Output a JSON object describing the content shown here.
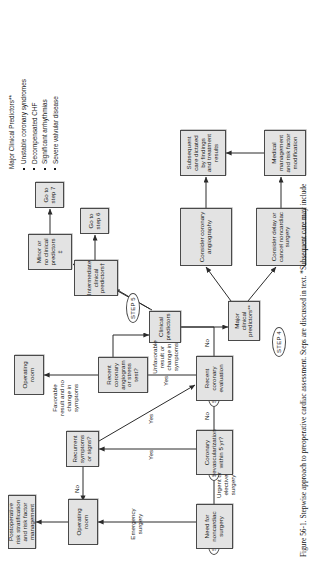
{
  "figure": {
    "number": "Figure 56-1.",
    "caption": "Stepwise approach to preoperative cardiac assessment. Steps are discussed in text. *Subsequent care may include"
  },
  "steps": [
    {
      "id": "step1",
      "label": "STEP 1"
    },
    {
      "id": "step2",
      "label": "STEP 2"
    },
    {
      "id": "step3",
      "label": "STEP 3"
    },
    {
      "id": "step4",
      "label": "STEP 4"
    },
    {
      "id": "step5",
      "label": "STEP 5"
    }
  ],
  "nodes": {
    "need_surgery": "Need for noncardiac surgery",
    "coronary_revasc": "Coronary revascularization within 5 yr?",
    "recent_coronary_eval": "Recent coronary evaluation",
    "operating_room_1": "Operating room",
    "postop_risk": "Postoperative risk stratification and risk factor management",
    "recurrent_symptoms": "Recurrent symptoms or signs?",
    "recent_angiogram": "Recent coronary angiogram or stress test?",
    "operating_room_2": "Operating room",
    "clinical_predictors": "Clinical predictors",
    "major_predictors": "Major clinical predictors**",
    "intermediate_predictors": "Intermediate clinical predictors†",
    "minor_predictors": "Minor or no clinical predictors ‡",
    "go_to_step6": "Go to step 6",
    "go_to_step7": "Go to step 7",
    "consider_angiography": "Consider coronary angiography",
    "consider_delay": "Consider delay or cancel noncardiac surgery",
    "subsequent_care": "Subsequent care dictated by findings and treatment results",
    "medical_management": "Medical management and risk factor modification"
  },
  "edge_labels": {
    "urgent_or_elective": "Urgent or elective surgery",
    "emergency": "Emergency surgery",
    "no_1": "No",
    "no_2": "No",
    "no_3": "No",
    "yes_1": "Yes",
    "yes_2": "Yes",
    "yes_3": "Yes",
    "favorable": "Favorable result and no change in symptoms",
    "unfavorable": "Unfavorable result or change in symptoms"
  },
  "legend": {
    "title": "Major Clinical Predictors**",
    "items": [
      "Unstable coronary syndromes",
      "Decompensated CHF",
      "Significant arrhythmias",
      "Severe valvular disease"
    ]
  },
  "colors": {
    "node_fill": "#e3e3e3",
    "node_border": "#4a4a4a",
    "text": "#1a1a1a",
    "page_bg": "#ffffff"
  }
}
